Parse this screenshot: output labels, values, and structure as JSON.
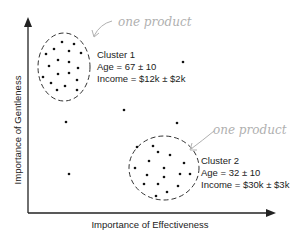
{
  "diagram": {
    "x_axis_label": "Importance of Effectiveness",
    "y_axis_label": "Importance of Gentleness",
    "annotation_1": "one product",
    "annotation_2": "one product",
    "cluster_1": {
      "title": "Cluster 1",
      "age": "Age = 67 ± 10",
      "income": "Income = $12k ± $2k"
    },
    "cluster_2": {
      "title": "Cluster 2",
      "age": "Age = 32 ± 10",
      "income": "Income = $30k ± $3k"
    },
    "colors": {
      "ink": "#222222",
      "handwriting": "#b0b0b0"
    }
  }
}
